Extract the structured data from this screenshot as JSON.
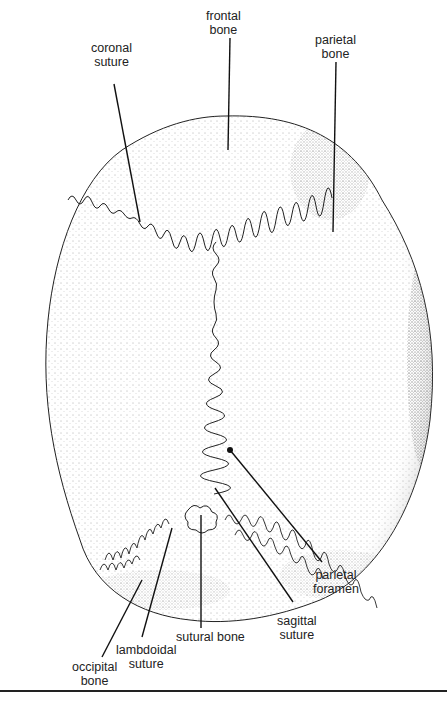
{
  "diagram": {
    "colors": {
      "ink": "#222222",
      "background": "#ffffff"
    },
    "labels": {
      "frontal_bone": {
        "line1": "frontal",
        "line2": "bone"
      },
      "coronal_suture": {
        "line1": "coronal",
        "line2": "suture"
      },
      "parietal_bone": {
        "line1": "parietal",
        "line2": "bone"
      },
      "parietal_foramen": {
        "line1": "parietal",
        "line2": "foramen"
      },
      "sagittal_suture": {
        "line1": "sagittal",
        "line2": "suture"
      },
      "sutural_bone": {
        "line1": "sutural bone"
      },
      "lambdoidal_suture": {
        "line1": "lambdoidal",
        "line2": "suture"
      },
      "occipital_bone": {
        "line1": "occipital",
        "line2": "bone"
      }
    }
  }
}
